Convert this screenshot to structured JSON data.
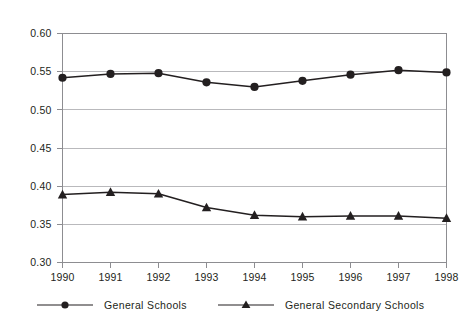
{
  "chart_data": {
    "type": "line",
    "title": "",
    "title_cropped": true,
    "xlabel": "",
    "ylabel": "",
    "x": [
      1990,
      1991,
      1992,
      1993,
      1994,
      1995,
      1996,
      1997,
      1998
    ],
    "xtick_labels": [
      "1990",
      "1991",
      "1992",
      "1993",
      "1994",
      "1995",
      "1996",
      "1997",
      "1998"
    ],
    "ytick_labels": [
      "0.60",
      "0.55",
      "0.50",
      "0.45",
      "0.40",
      "0.35",
      "0.30"
    ],
    "yticks": [
      0.6,
      0.55,
      0.5,
      0.45,
      0.4,
      0.35,
      0.3
    ],
    "ylim": [
      0.3,
      0.6
    ],
    "grid": "horizontal",
    "legend_position": "bottom-left",
    "series": [
      {
        "name": "General Schools",
        "marker": "circle",
        "color": "#231f20",
        "values": [
          0.542,
          0.547,
          0.548,
          0.536,
          0.53,
          0.538,
          0.546,
          0.552,
          0.549
        ]
      },
      {
        "name": "General Secondary Schools",
        "marker": "triangle",
        "color": "#231f20",
        "values": [
          0.389,
          0.392,
          0.39,
          0.372,
          0.362,
          0.36,
          0.361,
          0.361,
          0.358
        ]
      }
    ]
  },
  "axis": {
    "y_labels": [
      "0.60",
      "0.55",
      "0.50",
      "0.45",
      "0.40",
      "0.35",
      "0.30"
    ],
    "x_labels": [
      "1990",
      "1991",
      "1992",
      "1993",
      "1994",
      "1995",
      "1996",
      "1997",
      "1998"
    ]
  },
  "legend": {
    "entries": [
      {
        "label": "General Schools",
        "marker": "circle-marker"
      },
      {
        "label": "General Secondary Schools",
        "marker": "triangle-marker"
      }
    ]
  },
  "style": {
    "ink": "#231f20",
    "gridline": "#b9b9bc",
    "frame": "#8d8d91",
    "background": "#ffffff"
  }
}
